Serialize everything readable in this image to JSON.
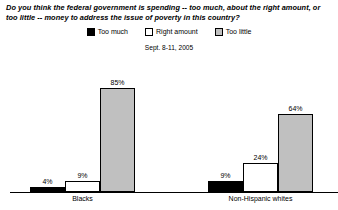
{
  "chart_data": {
    "type": "bar",
    "title": "Do you think the federal government is spending -- too much, about the right amount, or too little -- money to address the issue of poverty in this country?",
    "subtitle": "Sept. 8-11, 2005",
    "xlabel": "",
    "ylabel": "",
    "ylim": [
      0,
      100
    ],
    "grid": false,
    "legend_position": "top-center",
    "categories": [
      "Blacks",
      "Non-Hispanic whites"
    ],
    "series": [
      {
        "name": "Too much",
        "color": "#000000",
        "values": [
          4,
          9
        ],
        "labels": [
          "4%",
          "9%"
        ]
      },
      {
        "name": "Right amount",
        "color": "#ffffff",
        "values": [
          9,
          24
        ],
        "labels": [
          "9%",
          "24%"
        ]
      },
      {
        "name": "Too little",
        "color": "#c0c0c0",
        "values": [
          85,
          64
        ],
        "labels": [
          "85%",
          "64%"
        ]
      }
    ]
  },
  "legend": {
    "items": [
      {
        "label": "Too much",
        "swatch": "swatch-black"
      },
      {
        "label": "Right amount",
        "swatch": "swatch-white"
      },
      {
        "label": "Too little",
        "swatch": "swatch-gray"
      }
    ]
  },
  "colors": {
    "too_much": "#000000",
    "right_amount": "#ffffff",
    "too_little": "#c0c0c0",
    "axis": "#000000",
    "background": "#ffffff"
  }
}
